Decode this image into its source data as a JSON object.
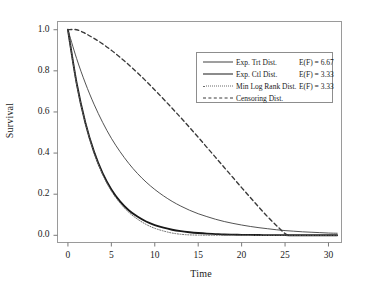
{
  "chart_data": {
    "type": "line",
    "title": "",
    "xlabel": "Time",
    "ylabel": "Survival",
    "xlim": [
      -1.2,
      31.5
    ],
    "ylim": [
      -0.035,
      1.04
    ],
    "xticks": [
      0,
      5,
      10,
      15,
      20,
      25,
      30
    ],
    "xtick_labels": [
      "0",
      "5",
      "10",
      "15",
      "20",
      "25",
      "30"
    ],
    "yticks": [
      0.0,
      0.2,
      0.4,
      0.6,
      0.8,
      1.0
    ],
    "ytick_labels": [
      "0.0",
      "0.2",
      "0.4",
      "0.6",
      "0.8",
      "1.0"
    ],
    "grid": false,
    "legend_position": "upper right",
    "panel_border": true,
    "series": [
      {
        "name": "Exp. Trt Dist.",
        "annotation": "E(F) = 6.67",
        "style": "solid-thin",
        "color": "#404040",
        "x": [
          0,
          1,
          2,
          3,
          4,
          5,
          6,
          7,
          8,
          9,
          10,
          11,
          12,
          13,
          14,
          15,
          16,
          17,
          18,
          19,
          20,
          21,
          22,
          23,
          24,
          25,
          26,
          27,
          28,
          29,
          30,
          31
        ],
        "values": [
          1.0,
          0.86,
          0.741,
          0.638,
          0.549,
          0.472,
          0.407,
          0.35,
          0.301,
          0.259,
          0.223,
          0.192,
          0.165,
          0.142,
          0.122,
          0.105,
          0.091,
          0.078,
          0.067,
          0.058,
          0.05,
          0.043,
          0.037,
          0.032,
          0.027,
          0.023,
          0.02,
          0.017,
          0.015,
          0.013,
          0.011,
          0.01
        ]
      },
      {
        "name": "Exp. Ctl Dist.",
        "annotation": "E(F) = 3.33",
        "style": "solid-thick",
        "color": "#181818",
        "x": [
          0,
          1,
          2,
          3,
          4,
          5,
          6,
          7,
          8,
          9,
          10,
          11,
          12,
          13,
          14,
          15,
          16,
          17,
          18,
          19,
          20,
          21,
          22,
          23,
          24,
          25,
          26,
          27,
          28,
          29,
          30,
          31
        ],
        "values": [
          1.0,
          0.741,
          0.549,
          0.407,
          0.301,
          0.223,
          0.165,
          0.122,
          0.091,
          0.067,
          0.05,
          0.037,
          0.027,
          0.02,
          0.015,
          0.011,
          0.008,
          0.006,
          0.004,
          0.003,
          0.0024,
          0.0018,
          0.0013,
          0.001,
          0.0007,
          0.0005,
          0.0004,
          0.0003,
          0.0002,
          0.00015,
          0.0001,
          0.0001
        ]
      },
      {
        "name": "Min Log Rank Dist.",
        "annotation": "E(F) = 3.33",
        "style": "dotted",
        "color": "#6a6a6a",
        "x": [
          0,
          1,
          2,
          3,
          4,
          5,
          6,
          7,
          8,
          9,
          10,
          11,
          12,
          13,
          14,
          15,
          16,
          17,
          18,
          19,
          20,
          21,
          22,
          23,
          24,
          25,
          26,
          27,
          28,
          29,
          30,
          31
        ],
        "values": [
          1.0,
          0.738,
          0.548,
          0.404,
          0.296,
          0.216,
          0.157,
          0.112,
          0.079,
          0.053,
          0.034,
          0.021,
          0.011,
          0.005,
          0.002,
          0.001,
          0.0005,
          0.0003,
          0.0002,
          0.0001,
          0.0001,
          0.0,
          0.0,
          0.0,
          0.0,
          0.0,
          0.0,
          0.0,
          0.0,
          0.0,
          0.0,
          0.0
        ]
      },
      {
        "name": "Censoring Dist.",
        "annotation": "",
        "style": "dashed",
        "color": "#3a3a3a",
        "x": [
          0,
          1,
          2,
          3,
          4,
          5,
          6,
          7,
          8,
          9,
          10,
          11,
          12,
          13,
          14,
          15,
          16,
          17,
          18,
          19,
          20,
          21,
          22,
          23,
          24,
          25,
          25.5
        ],
        "values": [
          1.0,
          1.0,
          0.982,
          0.958,
          0.931,
          0.9,
          0.866,
          0.83,
          0.791,
          0.75,
          0.707,
          0.663,
          0.618,
          0.572,
          0.525,
          0.477,
          0.428,
          0.379,
          0.33,
          0.281,
          0.232,
          0.184,
          0.136,
          0.09,
          0.048,
          0.008,
          0.0
        ]
      }
    ]
  },
  "legend": {
    "rows": [
      {
        "label": "Exp. Trt Dist.",
        "value": "E(F) = 6.67"
      },
      {
        "label": "Exp. Ctl Dist.",
        "value": "E(F) = 3.33"
      },
      {
        "label": "Min Log Rank Dist.",
        "value": "E(F) = 3.33"
      },
      {
        "label": "Censoring Dist.",
        "value": ""
      }
    ]
  }
}
